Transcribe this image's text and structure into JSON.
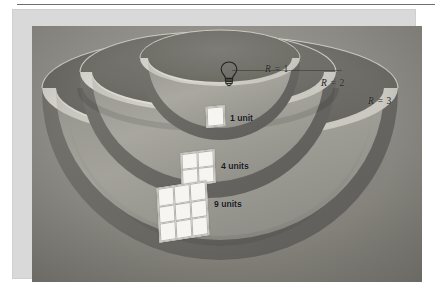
{
  "figure": {
    "kind": "inverse-square-law-diagram",
    "background_color": "#8d8d8d",
    "mat_color": "#d9d9d9",
    "shells": [
      {
        "id": "shell-1",
        "radius_label": "R = 1",
        "radius_value": 1,
        "area_label": "1 unit",
        "area_value": 1
      },
      {
        "id": "shell-2",
        "radius_label": "R = 2",
        "radius_value": 2,
        "area_label": "4 units",
        "area_value": 4
      },
      {
        "id": "shell-3",
        "radius_label": "R = 3",
        "radius_value": 3,
        "area_label": "9 units",
        "area_value": 9
      }
    ],
    "radius_labels": {
      "r1": {
        "prefix": "R",
        "eq": " = ",
        "value": "1"
      },
      "r2": {
        "prefix": "R",
        "eq": " = ",
        "value": "2"
      },
      "r3": {
        "prefix": "R",
        "eq": " = ",
        "value": "3"
      }
    },
    "area_labels": {
      "a1": "1 unit",
      "a4": "4 units",
      "a9": "9 units"
    },
    "source_icon": "light-bulb-icon",
    "patch_grid_sizes": {
      "a1": "1x1",
      "a4": "2x2",
      "a9": "3x3"
    },
    "colors": {
      "shell_outer_dark": "#6e6e6e",
      "shell_inner_light": "#cfcdc6",
      "rim_highlight": "#e3e1d9",
      "label_text": "#15181c"
    }
  }
}
